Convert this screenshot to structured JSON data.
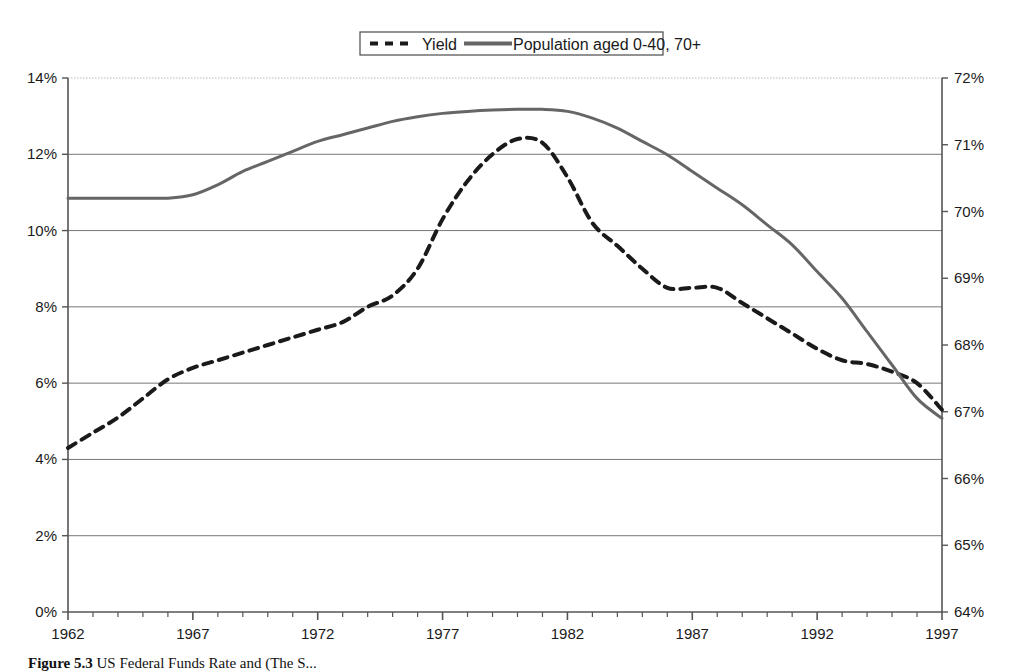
{
  "figure": {
    "caption_label": "Figure 5.3",
    "caption_text": "US Federal Funds Rate and (The S..."
  },
  "legend": {
    "position": "top-center",
    "items": [
      {
        "label": "Yield",
        "style": "dashed",
        "color": "#1a1a1a",
        "axis": "left"
      },
      {
        "label": "Population aged 0-40, 70+",
        "style": "solid",
        "color": "#666666",
        "axis": "right"
      }
    ]
  },
  "axes": {
    "left": {
      "ticks": [
        "0%",
        "2%",
        "4%",
        "6%",
        "8%",
        "10%",
        "12%",
        "14%"
      ],
      "min": 0,
      "max": 14,
      "step": 2,
      "unit": "%"
    },
    "right": {
      "ticks": [
        "64%",
        "65%",
        "66%",
        "67%",
        "68%",
        "69%",
        "70%",
        "71%",
        "72%"
      ],
      "min": 64,
      "max": 72,
      "step": 1,
      "unit": "%"
    },
    "x": {
      "labels": [
        "1962",
        "1967",
        "1972",
        "1977",
        "1982",
        "1987",
        "1992",
        "1997"
      ],
      "min": 1962,
      "max": 1997,
      "label_step": 5,
      "tick_step": 1
    }
  },
  "chart_data": {
    "type": "line",
    "title": "",
    "xlabel": "",
    "ylabel": "",
    "grid": true,
    "legend_position": "top-center",
    "x": [
      1962,
      1963,
      1964,
      1965,
      1966,
      1967,
      1968,
      1969,
      1970,
      1971,
      1972,
      1973,
      1974,
      1975,
      1976,
      1977,
      1978,
      1979,
      1980,
      1981,
      1982,
      1983,
      1984,
      1985,
      1986,
      1987,
      1988,
      1989,
      1990,
      1991,
      1992,
      1993,
      1994,
      1995,
      1996,
      1997
    ],
    "series": [
      {
        "name": "Yield",
        "axis": "left",
        "style": "dashed",
        "color": "#1a1a1a",
        "ylim": [
          0,
          14
        ],
        "unit": "%",
        "values": [
          4.3,
          4.7,
          5.1,
          5.6,
          6.1,
          6.4,
          6.6,
          6.8,
          7.0,
          7.2,
          7.4,
          7.6,
          8.0,
          8.3,
          9.0,
          10.3,
          11.3,
          12.0,
          12.4,
          12.3,
          11.4,
          10.2,
          9.6,
          9.0,
          8.5,
          8.5,
          8.5,
          8.1,
          7.7,
          7.3,
          6.9,
          6.6,
          6.5,
          6.3,
          6.0,
          5.3
        ]
      },
      {
        "name": "Population aged 0-40, 70+",
        "axis": "right",
        "style": "solid",
        "color": "#666666",
        "ylim": [
          64,
          72
        ],
        "unit": "%",
        "values": [
          70.2,
          70.2,
          70.2,
          70.2,
          70.2,
          70.25,
          70.4,
          70.6,
          70.75,
          70.9,
          71.05,
          71.15,
          71.25,
          71.35,
          71.42,
          71.47,
          71.5,
          71.52,
          71.53,
          71.53,
          71.5,
          71.4,
          71.25,
          71.05,
          70.85,
          70.6,
          70.35,
          70.1,
          69.8,
          69.5,
          69.1,
          68.7,
          68.2,
          67.7,
          67.2,
          66.9
        ]
      }
    ]
  }
}
